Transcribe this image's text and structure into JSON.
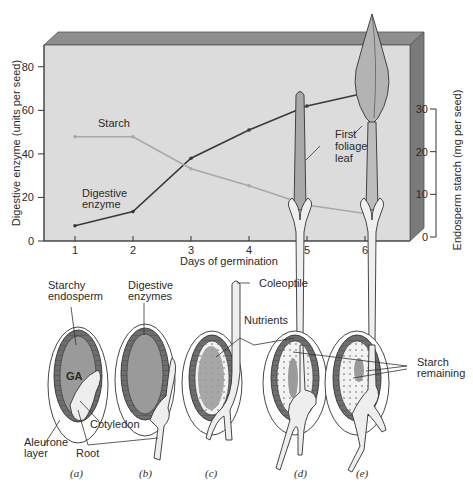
{
  "chart_data": {
    "type": "line",
    "title": "",
    "xlabel": "Days of germination",
    "ylabel": "Digestive enzyme (units per seed)",
    "y2label": "Endosperm starch (mg per seed)",
    "x": [
      1,
      2,
      3,
      4,
      5,
      6
    ],
    "xticks": [
      "1",
      "2",
      "3",
      "4",
      "5",
      "6"
    ],
    "ylim": [
      0,
      90
    ],
    "yticks": [
      "0",
      "20",
      "40",
      "60",
      "80"
    ],
    "y2lim": [
      0,
      30
    ],
    "y2ticks": [
      "0",
      "10",
      "20",
      "30"
    ],
    "grid": false,
    "series": [
      {
        "name": "Digestive enzyme",
        "axis": "left",
        "label_line1": "Digestive",
        "label_line2": "enzyme",
        "color": "#3a3a3a",
        "values": [
          7,
          13.5,
          38,
          51,
          62,
          68
        ]
      },
      {
        "name": "Starch",
        "axis": "right",
        "label_line1": "Starch",
        "color": "#a8a8a8",
        "values": [
          23.5,
          23.5,
          16,
          12,
          7.5,
          5.5
        ]
      }
    ],
    "annotations": [
      "First foliage leaf"
    ]
  },
  "chart": {
    "xlabel": "Days of germination",
    "ylabel": "Digestive enzyme (units per seed)",
    "y2label": "Endosperm starch (mg per seed)",
    "starch_label": "Starch",
    "enzyme_label_1": "Digestive",
    "enzyme_label_2": "enzyme",
    "leaf_label_1": "First",
    "leaf_label_2": "foliage",
    "leaf_label_3": "leaf",
    "colors": {
      "panel_face": "#dcdcdc",
      "panel_top": "#8e8e8e",
      "panel_side": "#7a7a7a",
      "enzyme": "#3a3a3a",
      "starch": "#a8a8a8"
    }
  },
  "diagram": {
    "labels": {
      "starchy_1": "Starchy",
      "starchy_2": "endosperm",
      "digestive_1": "Digestive",
      "digestive_2": "enzymes",
      "ga": "GA",
      "cotyledon": "Cotyledon",
      "aleurone_1": "Aleurone",
      "aleurone_2": "layer",
      "root": "Root",
      "coleoptile": "Coleoptile",
      "nutrients": "Nutrients",
      "starch_rem_1": "Starch",
      "starch_rem_2": "remaining"
    },
    "panels": [
      "(a)",
      "(b)",
      "(c)",
      "(d)",
      "(e)"
    ]
  }
}
